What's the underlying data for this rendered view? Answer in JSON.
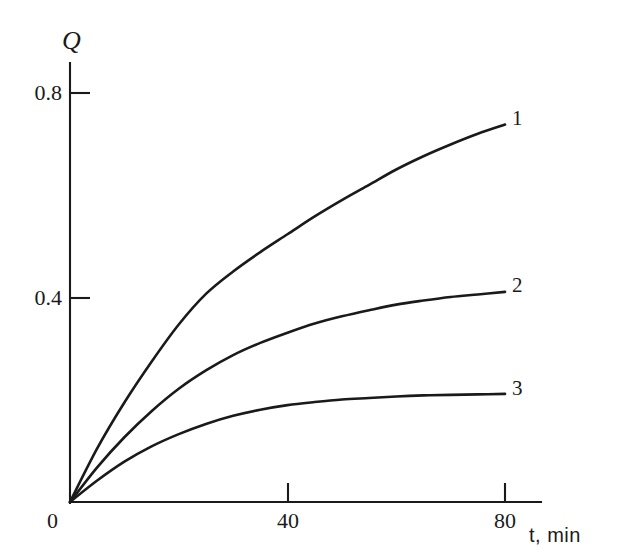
{
  "chart_data": {
    "type": "line",
    "title": "",
    "subtitle": "",
    "xlabel": "t, min",
    "ylabel": "Q",
    "xlim": [
      0,
      86
    ],
    "ylim": [
      0,
      0.86
    ],
    "grid": false,
    "legend_position": "inline-right-end",
    "xticks": [
      {
        "value": 0,
        "label": "0"
      },
      {
        "value": 40,
        "label": "40"
      },
      {
        "value": 80,
        "label": "80"
      }
    ],
    "yticks": [
      {
        "value": 0.4,
        "label": "0.4"
      },
      {
        "value": 0.8,
        "label": "0.8"
      }
    ],
    "origin_label": "0",
    "x": [
      0,
      5,
      10,
      15,
      20,
      25,
      30,
      35,
      40,
      45,
      50,
      55,
      60,
      65,
      70,
      75,
      80
    ],
    "series": [
      {
        "name": "1",
        "label": "1",
        "color": "#1a1a1a",
        "values": [
          0.0,
          0.105,
          0.195,
          0.275,
          0.348,
          0.408,
          0.452,
          0.49,
          0.525,
          0.56,
          0.592,
          0.622,
          0.652,
          0.678,
          0.701,
          0.722,
          0.74
        ]
      },
      {
        "name": "2",
        "label": "2",
        "color": "#1a1a1a",
        "values": [
          0.0,
          0.068,
          0.127,
          0.178,
          0.222,
          0.258,
          0.288,
          0.312,
          0.332,
          0.35,
          0.364,
          0.376,
          0.387,
          0.395,
          0.402,
          0.407,
          0.412
        ]
      },
      {
        "name": "3",
        "label": "3",
        "color": "#1a1a1a",
        "values": [
          0.0,
          0.042,
          0.079,
          0.109,
          0.133,
          0.153,
          0.169,
          0.181,
          0.19,
          0.196,
          0.201,
          0.204,
          0.207,
          0.209,
          0.21,
          0.211,
          0.212
        ]
      }
    ],
    "axis_color": "#1a1a1a",
    "background_color": "#ffffff"
  },
  "labels": {
    "y_axis_title": "Q",
    "x_axis_title": "t, min",
    "origin": "0",
    "ytick_08": "0.8",
    "ytick_04": "0.4",
    "xtick_40": "40",
    "xtick_80": "80",
    "curve_1": "1",
    "curve_2": "2",
    "curve_3": "3"
  }
}
